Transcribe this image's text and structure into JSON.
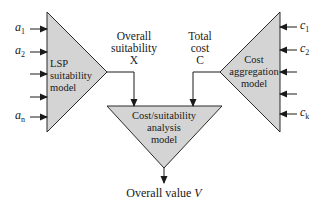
{
  "colors": {
    "fill": "#d4d4d4",
    "stroke": "#2a2a2a",
    "text": "#1a1a1a",
    "background": "#ffffff"
  },
  "lsp_model": {
    "lines": [
      "LSP",
      "suitability",
      "model"
    ],
    "inputs": [
      {
        "base": "a",
        "sub": "1"
      },
      {
        "base": "a",
        "sub": "2"
      },
      {
        "base": "",
        "sub": ""
      },
      {
        "base": "",
        "sub": ""
      },
      {
        "base": "a",
        "sub": "n"
      }
    ]
  },
  "cost_model": {
    "lines": [
      "Cost",
      "aggregation",
      "model"
    ],
    "inputs": [
      {
        "base": "c",
        "sub": "1"
      },
      {
        "base": "c",
        "sub": "2"
      },
      {
        "base": "",
        "sub": ""
      },
      {
        "base": "",
        "sub": ""
      },
      {
        "base": "c",
        "sub": "k"
      }
    ]
  },
  "analysis_model": {
    "lines": [
      "Cost/suitability",
      "analysis",
      "model"
    ]
  },
  "signals": {
    "suitability": {
      "line1": "Overall",
      "line2": "suitability",
      "symbol": "X"
    },
    "cost": {
      "line1": "Total",
      "line2": "cost",
      "symbol": "C"
    }
  },
  "output": {
    "label": "Overall value",
    "symbol": "V"
  }
}
